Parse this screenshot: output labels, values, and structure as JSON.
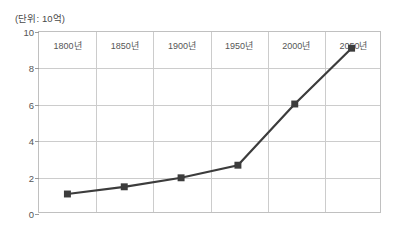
{
  "caption": {
    "unit_note": "(단위: 10억)"
  },
  "colors": {
    "series": "#3c3c3c",
    "gridline": "#cccccc",
    "frame": "#c0c0c0",
    "tick_text": "#555555",
    "caption_text": "#4a4a4a",
    "background": "#ffffff"
  },
  "axes": {
    "y_ticks": [
      "0",
      "2",
      "4",
      "6",
      "8",
      "10"
    ],
    "x_ticks": [
      "1800년",
      "1850년",
      "1900년",
      "1950년",
      "2000년",
      "2050년"
    ]
  },
  "chart_data": {
    "type": "line",
    "title": "",
    "subtitle": "",
    "xlabel": "",
    "ylabel": "(단위: 10억)",
    "categories": [
      "1800년",
      "1850년",
      "1900년",
      "1950년",
      "2000년",
      "2050년"
    ],
    "values": [
      1.0,
      1.4,
      1.9,
      2.6,
      6.0,
      9.1
    ],
    "ylim": [
      0,
      10
    ],
    "yticks": [
      0,
      2,
      4,
      6,
      8,
      10
    ],
    "grid": true,
    "legend": "none",
    "marker": "square",
    "series": [
      {
        "name": "세계 인구",
        "values": [
          1.0,
          1.4,
          1.9,
          2.6,
          6.0,
          9.1
        ]
      }
    ]
  }
}
